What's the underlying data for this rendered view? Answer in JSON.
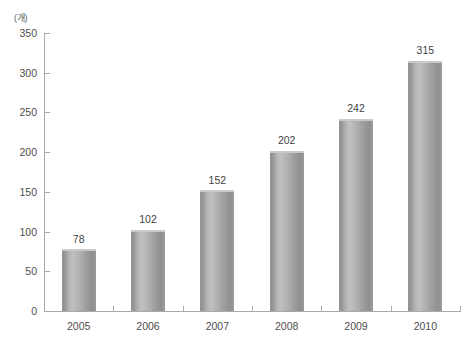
{
  "chart_data": {
    "type": "bar",
    "title": "",
    "subtitle": "",
    "xlabel": "",
    "ylabel": "",
    "unit_label": "(개)",
    "categories": [
      "2005",
      "2006",
      "2007",
      "2008",
      "2009",
      "2010"
    ],
    "values": [
      78,
      102,
      152,
      202,
      242,
      315
    ],
    "value_labels": [
      "78",
      "102",
      "152",
      "202",
      "242",
      "315"
    ],
    "ylim": [
      0,
      350
    ],
    "ytick_values": [
      0,
      50,
      100,
      150,
      200,
      250,
      300,
      350
    ],
    "ytick_labels": [
      "0",
      "50",
      "100",
      "150",
      "200",
      "250",
      "300",
      "350"
    ],
    "grid": false,
    "legend": null,
    "legend_position": "none",
    "series": [
      {
        "name": "",
        "values": [
          78,
          102,
          152,
          202,
          242,
          315
        ]
      }
    ],
    "style": {
      "bar_shape": "cylinder",
      "bar_fill_light": "#c0c0c0",
      "bar_fill_dark": "#8e8e8e",
      "axis_color": "#a9a9a9",
      "text_color": "#4e4e4e",
      "value_text_color": "#3f3f3f",
      "background": "#ffffff"
    }
  }
}
